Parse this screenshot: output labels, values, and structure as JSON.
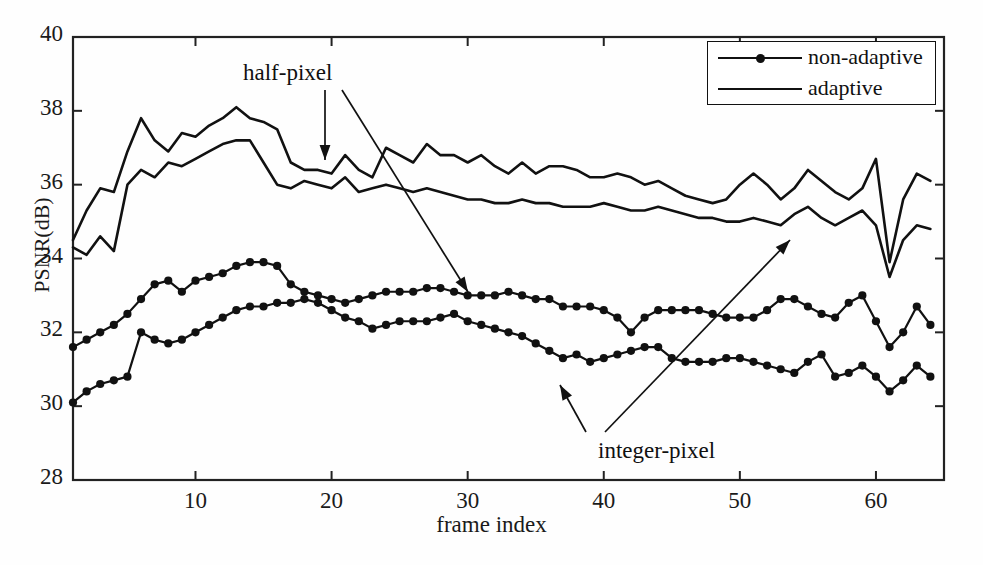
{
  "chart_data": {
    "type": "line",
    "title": "",
    "xlabel": "frame index",
    "ylabel": "PSNR(dB)",
    "xlim": [
      1,
      65
    ],
    "ylim": [
      28,
      40
    ],
    "xticks": [
      10,
      20,
      30,
      40,
      50,
      60
    ],
    "yticks": [
      28,
      30,
      32,
      34,
      36,
      38,
      40
    ],
    "grid": false,
    "legend_position": "top-right",
    "annotations": [
      {
        "text": "half-pixel",
        "x": 18,
        "y": 38.6
      },
      {
        "text": "integer-pixel",
        "x": 41,
        "y": 28.9
      }
    ],
    "x": [
      1,
      2,
      3,
      4,
      5,
      6,
      7,
      8,
      9,
      10,
      11,
      12,
      13,
      14,
      15,
      16,
      17,
      18,
      19,
      20,
      21,
      22,
      23,
      24,
      25,
      26,
      27,
      28,
      29,
      30,
      31,
      32,
      33,
      34,
      35,
      36,
      37,
      38,
      39,
      40,
      41,
      42,
      43,
      44,
      45,
      46,
      47,
      48,
      49,
      50,
      51,
      52,
      53,
      54,
      55,
      56,
      57,
      58,
      59,
      60,
      61,
      62,
      63,
      64
    ],
    "series": [
      {
        "name": "adaptive",
        "group": "half-pixel",
        "marker": false,
        "values": [
          34.5,
          35.3,
          35.9,
          35.8,
          36.9,
          37.8,
          37.2,
          36.9,
          37.4,
          37.3,
          37.6,
          37.8,
          38.1,
          37.8,
          37.7,
          37.5,
          36.6,
          36.4,
          36.4,
          36.3,
          36.8,
          36.4,
          36.2,
          37.0,
          36.8,
          36.6,
          37.1,
          36.8,
          36.8,
          36.6,
          36.8,
          36.5,
          36.3,
          36.6,
          36.3,
          36.5,
          36.5,
          36.4,
          36.2,
          36.2,
          36.3,
          36.2,
          36.0,
          36.1,
          35.9,
          35.7,
          35.6,
          35.5,
          35.6,
          36.0,
          36.3,
          36.0,
          35.6,
          35.9,
          36.4,
          36.1,
          35.8,
          35.6,
          35.9,
          36.7,
          33.9,
          35.6,
          36.3,
          36.1
        ]
      },
      {
        "name": "non-adaptive",
        "group": "half-pixel",
        "marker": false,
        "values": [
          34.3,
          34.1,
          34.6,
          34.2,
          36.0,
          36.4,
          36.2,
          36.6,
          36.5,
          36.7,
          36.9,
          37.1,
          37.2,
          37.2,
          36.6,
          36.0,
          35.9,
          36.1,
          36.0,
          35.9,
          36.2,
          35.8,
          35.9,
          36.0,
          35.9,
          35.8,
          35.9,
          35.8,
          35.7,
          35.6,
          35.6,
          35.5,
          35.5,
          35.6,
          35.5,
          35.5,
          35.4,
          35.4,
          35.4,
          35.5,
          35.4,
          35.3,
          35.3,
          35.4,
          35.3,
          35.2,
          35.1,
          35.1,
          35.0,
          35.0,
          35.1,
          35.0,
          34.9,
          35.2,
          35.4,
          35.1,
          34.9,
          35.1,
          35.3,
          34.9,
          33.5,
          34.5,
          34.9,
          34.8
        ]
      },
      {
        "name": "adaptive",
        "group": "integer-pixel",
        "marker": true,
        "values": [
          31.6,
          31.8,
          32.0,
          32.2,
          32.5,
          32.9,
          33.3,
          33.4,
          33.1,
          33.4,
          33.5,
          33.6,
          33.8,
          33.9,
          33.9,
          33.8,
          33.3,
          33.1,
          33.0,
          32.9,
          32.8,
          32.9,
          33.0,
          33.1,
          33.1,
          33.1,
          33.2,
          33.2,
          33.1,
          33.0,
          33.0,
          33.0,
          33.1,
          33.0,
          32.9,
          32.9,
          32.7,
          32.7,
          32.7,
          32.6,
          32.4,
          32.0,
          32.4,
          32.6,
          32.6,
          32.6,
          32.6,
          32.5,
          32.4,
          32.4,
          32.4,
          32.6,
          32.9,
          32.9,
          32.7,
          32.5,
          32.4,
          32.8,
          33.0,
          32.3,
          31.6,
          32.0,
          32.7,
          32.2
        ]
      },
      {
        "name": "non-adaptive",
        "group": "integer-pixel",
        "marker": true,
        "values": [
          30.1,
          30.4,
          30.6,
          30.7,
          30.8,
          32.0,
          31.8,
          31.7,
          31.8,
          32.0,
          32.2,
          32.4,
          32.6,
          32.7,
          32.7,
          32.8,
          32.8,
          32.9,
          32.8,
          32.6,
          32.4,
          32.3,
          32.1,
          32.2,
          32.3,
          32.3,
          32.3,
          32.4,
          32.5,
          32.3,
          32.2,
          32.1,
          32.0,
          31.9,
          31.7,
          31.5,
          31.3,
          31.4,
          31.2,
          31.3,
          31.4,
          31.5,
          31.6,
          31.6,
          31.3,
          31.2,
          31.2,
          31.2,
          31.3,
          31.3,
          31.2,
          31.1,
          31.0,
          30.9,
          31.2,
          31.4,
          30.8,
          30.9,
          31.1,
          30.8,
          30.4,
          30.7,
          31.1,
          30.8
        ]
      }
    ]
  },
  "legend": {
    "entries": [
      {
        "label": "non-adaptive",
        "marker": true
      },
      {
        "label": "adaptive",
        "marker": false
      }
    ]
  },
  "axes": {
    "xlabel": "frame index",
    "ylabel": "PSNR(dB)"
  },
  "annotations": {
    "half_pixel": "half-pixel",
    "integer_pixel": "integer-pixel"
  },
  "colors": {
    "line": "#111111",
    "axis": "#222222",
    "background": "#ffffff"
  }
}
